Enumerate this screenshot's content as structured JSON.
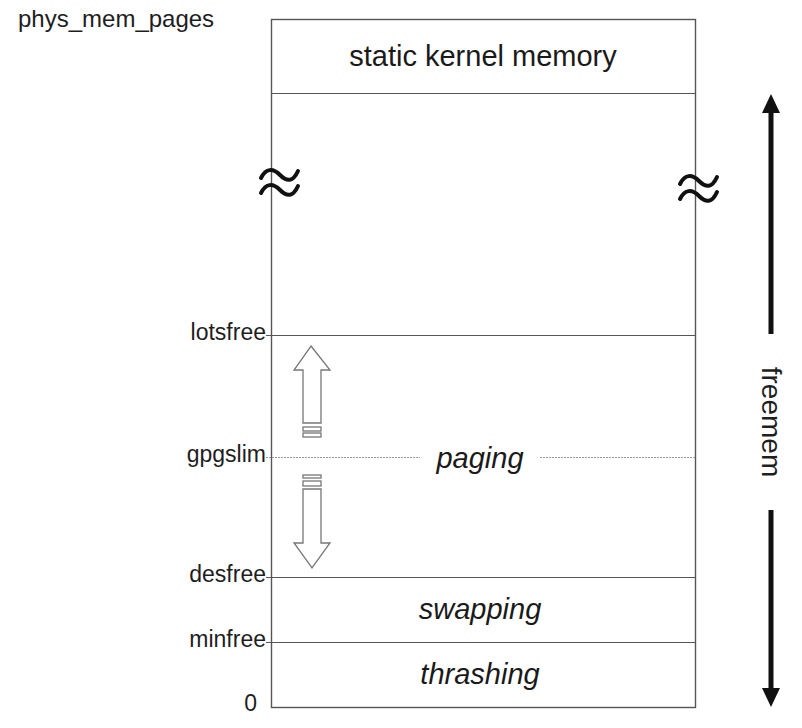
{
  "diagram": {
    "axis_top_label": "phys_mem_pages",
    "axis_bottom_label": "0",
    "thresholds": [
      {
        "name": "lotsfree",
        "label": "lotsfree"
      },
      {
        "name": "gpgslim",
        "label": "gpgslim"
      },
      {
        "name": "desfree",
        "label": "desfree"
      },
      {
        "name": "minfree",
        "label": "minfree"
      }
    ],
    "regions": [
      {
        "name": "static-kernel-memory",
        "label": "static kernel memory",
        "style": "normal"
      },
      {
        "name": "paging",
        "label": "paging",
        "style": "italic"
      },
      {
        "name": "swapping",
        "label": "swapping",
        "style": "italic"
      },
      {
        "name": "thrashing",
        "label": "thrashing",
        "style": "italic"
      }
    ],
    "break_symbol": "≈",
    "freemem_label": "freemem",
    "paging_arrows": [
      {
        "direction": "up",
        "meaning": "paging scan rate decreases toward lotsfree"
      },
      {
        "direction": "down",
        "meaning": "paging scan rate increases toward desfree"
      }
    ],
    "colors": {
      "line": "#555555",
      "dotted_line": "#9a9a9a",
      "text": "#1e1e1e",
      "arrow": "#111111",
      "hollow_arrow": "#777777"
    }
  }
}
